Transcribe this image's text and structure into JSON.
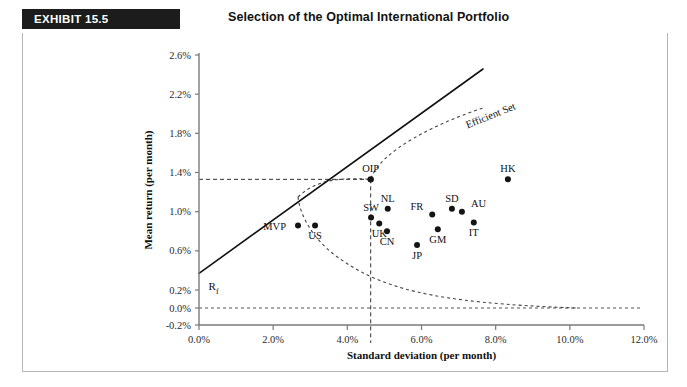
{
  "header": {
    "exhibit_tag": "EXHIBIT 15.5",
    "title": "Selection of the Optimal International Portfolio"
  },
  "chart_data": {
    "type": "scatter",
    "title": "Selection of the Optimal International Portfolio",
    "xlabel": "Standard deviation (per month)",
    "ylabel": "Mean return (per month)",
    "xlim": [
      0.0,
      12.0
    ],
    "ylim": [
      -0.2,
      2.6
    ],
    "grid": false,
    "legend_position": "none",
    "xticks": [
      "0.0%",
      "2.0%",
      "4.0%",
      "6.0%",
      "8.0%",
      "10.0%",
      "12.0%"
    ],
    "xtick_values": [
      0.0,
      2.0,
      4.0,
      6.0,
      8.0,
      10.0,
      12.0
    ],
    "yticks": [
      "2.6%",
      "2.2%",
      "1.8%",
      "1.4%",
      "1.0%",
      "0.6%",
      "0.2%",
      "0.0%",
      "-0.2%"
    ],
    "ytick_values": [
      2.6,
      2.2,
      1.8,
      1.4,
      1.0,
      0.6,
      0.2,
      0.0,
      -0.2
    ],
    "points": [
      {
        "label": "MVP",
        "x": 2.67,
        "y": 0.86,
        "label_pos": "left"
      },
      {
        "label": "US",
        "x": 3.13,
        "y": 0.86,
        "label_pos": "below"
      },
      {
        "label": "SW",
        "x": 4.64,
        "y": 0.94,
        "label_pos": "above"
      },
      {
        "label": "NL",
        "x": 5.09,
        "y": 1.03,
        "label_pos": "above"
      },
      {
        "label": "UK",
        "x": 4.86,
        "y": 0.88,
        "label_pos": "below"
      },
      {
        "label": "CN",
        "x": 5.07,
        "y": 0.8,
        "label_pos": "below"
      },
      {
        "label": "FR",
        "x": 6.29,
        "y": 0.97,
        "label_pos": "above-left"
      },
      {
        "label": "SD",
        "x": 6.82,
        "y": 1.03,
        "label_pos": "above"
      },
      {
        "label": "AU",
        "x": 7.09,
        "y": 1.0,
        "label_pos": "above-right"
      },
      {
        "label": "IT",
        "x": 7.41,
        "y": 0.89,
        "label_pos": "below"
      },
      {
        "label": "GM",
        "x": 6.44,
        "y": 0.82,
        "label_pos": "below"
      },
      {
        "label": "JP",
        "x": 5.88,
        "y": 0.66,
        "label_pos": "below"
      },
      {
        "label": "HK",
        "x": 8.33,
        "y": 1.33,
        "label_pos": "above"
      },
      {
        "label": "OIP",
        "x": 4.63,
        "y": 1.33,
        "label_pos": "above"
      }
    ],
    "annotations": [
      {
        "name": "efficient-set",
        "text": "Efficient Set",
        "x": 7.9,
        "y": 1.95,
        "rotation": -22
      },
      {
        "name": "risk-free-rate",
        "text": "R",
        "subscript": "f",
        "x": 0.15,
        "y": 0.4
      }
    ],
    "lines": [
      {
        "name": "capital-market-line",
        "style": "solid",
        "from": {
          "x": 0.0,
          "y": 0.37
        },
        "to": {
          "x": 11.6,
          "y": 2.35
        }
      },
      {
        "name": "efficient-frontier-upper",
        "style": "dashed"
      },
      {
        "name": "efficient-frontier-lower",
        "style": "dashed"
      },
      {
        "name": "oip-vertical-guide",
        "style": "dashed"
      },
      {
        "name": "oip-horizontal-guide",
        "style": "dashed"
      },
      {
        "name": "zero-return-guide",
        "style": "dashed"
      }
    ]
  }
}
